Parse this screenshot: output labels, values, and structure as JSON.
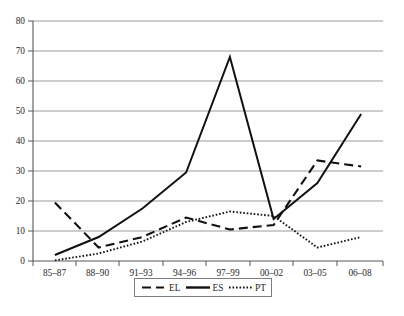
{
  "chart_data": {
    "type": "line",
    "title": "",
    "subtitle": "",
    "xlabel": "",
    "ylabel": "",
    "categories": [
      "85–87",
      "88–90",
      "91–93",
      "94–96",
      "97–99",
      "00–02",
      "03–05",
      "06–08"
    ],
    "x_tick_labels": [
      "85–87",
      "88–90",
      "91–93",
      "94–96",
      "97–99",
      "00–02",
      "03–05",
      "06–08"
    ],
    "y_tick_labels": [
      "0",
      "10",
      "20",
      "30",
      "40",
      "50",
      "60",
      "70",
      "80"
    ],
    "y_ticks": [
      0,
      10,
      20,
      30,
      40,
      50,
      60,
      70,
      80
    ],
    "ylim": [
      0,
      80
    ],
    "grid": "horizontal",
    "legend_position": "bottom-center",
    "series": [
      {
        "name": "EL",
        "style": "dashed",
        "color": "#111111",
        "values": [
          19.5,
          4.5,
          8.0,
          14.5,
          10.5,
          12.0,
          33.5,
          31.5
        ]
      },
      {
        "name": "ES",
        "style": "solid",
        "color": "#111111",
        "values": [
          2.0,
          8.0,
          17.5,
          29.5,
          68.0,
          14.0,
          26.0,
          49.0
        ]
      },
      {
        "name": "PT",
        "style": "dotted",
        "color": "#111111",
        "values": [
          0.2,
          2.5,
          6.5,
          13.0,
          16.5,
          15.0,
          4.5,
          8.0
        ]
      }
    ],
    "legend": [
      "EL",
      "ES",
      "PT"
    ]
  },
  "legend": {
    "items": [
      {
        "label": "EL",
        "style": "dashed"
      },
      {
        "label": "ES",
        "style": "solid"
      },
      {
        "label": "PT",
        "style": "dotted"
      }
    ]
  },
  "caption": {
    "partial_text": ""
  }
}
